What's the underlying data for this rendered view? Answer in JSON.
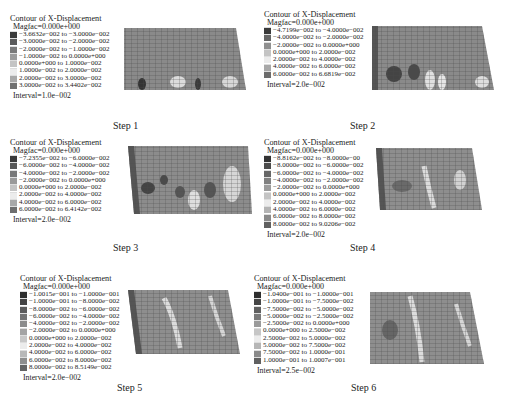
{
  "figure": {
    "panels": [
      {
        "step_label": "Step 1",
        "legend": {
          "title": "Contour of X-Displacement",
          "magfac": "Magfac=0.000e+000",
          "ranges": [
            "−3.6632e−002 to −3.0000e−002",
            "−3.0000e−002 to −2.0000e−002",
            "−2.0000e−002 to −1.0000e−002",
            "−1.0000e−002 to 0.0000e+000",
            "0.0000e+000 to 1.0000e−002",
            "1.0000e−002 to 2.0000e−002",
            "2.0000e−002 to 3.0000e−002",
            "3.0000e−002 to 3.4402e−002"
          ],
          "swatch_colors": [
            "#3a3a3a",
            "#5a5a5a",
            "#7a7a7a",
            "#9c9c9c",
            "#c4c4c4",
            "#ececec",
            "#a8a8a8",
            "#707070"
          ],
          "interval": "Interval=1.0e−002"
        }
      },
      {
        "step_label": "Step 2",
        "legend": {
          "title": "Contour of X-Displacement",
          "magfac": "Magfac=0.000e+000",
          "ranges": [
            "−4.7199e−002 to −4.0000e−002",
            "−4.0000e−002 to −2.0000e−002",
            "−2.0000e−002 to 0.0000e+000",
            "0.0000e+000 to 2.0000e−002",
            "2.0000e−002 to 4.0000e−002",
            "4.0000e−002 to 6.0000e−002",
            "6.0000e−002 to 6.6819e−002"
          ],
          "swatch_colors": [
            "#3a3a3a",
            "#666666",
            "#909090",
            "#c4c4c4",
            "#ececec",
            "#a8a8a8",
            "#6c6c6c"
          ],
          "interval": "Interval=2.0e−002"
        }
      },
      {
        "step_label": "Step 3",
        "legend": {
          "title": "Contour of X-Displacement",
          "magfac": "Magfac=0.000e+000",
          "ranges": [
            "−7.2355e−002 to −6.0000e−002",
            "−6.0000e−002 to −4.0000e−002",
            "−4.0000e−002 to −2.0000e−002",
            "−2.0000e−002 to 0.0000e+000",
            "0.0000e+000 to 2.0000e−002",
            "2.0000e−002 to 4.0000e−002",
            "4.0000e−002 to 6.0000e−002",
            "6.0000e−002 to 6.4142e−002"
          ],
          "swatch_colors": [
            "#3a3a3a",
            "#585858",
            "#787878",
            "#9a9a9a",
            "#c4c4c4",
            "#ececec",
            "#a8a8a8",
            "#6e6e6e"
          ],
          "interval": "Interval=2.0e−002"
        }
      },
      {
        "step_label": "Step 4",
        "legend": {
          "title": "Contour of X-Displacement",
          "magfac": "Magfac=0.000e+000",
          "ranges": [
            "−8.8162e−002 to −8.0000e−00",
            "−8.0000e−002 to −6.0000e−002",
            "−6.0000e−002 to −4.0000e−002",
            "−4.0000e−002 to −2.0000e−002",
            "−2.0000e−002 to 0.0000e+000",
            "0.0000e+000 to 2.0000e−002",
            "2.0000e−002 to 4.0000e−002",
            "4.0000e−002 to 6.0000e−002",
            "6.0000e−002 to 8.0000e−002",
            "8.0000e−002 to 9.0206e−002"
          ],
          "swatch_colors": [
            "#333333",
            "#4c4c4c",
            "#666666",
            "#808080",
            "#9c9c9c",
            "#c4c4c4",
            "#ececec",
            "#b4b4b4",
            "#8a8a8a",
            "#606060"
          ],
          "interval": "Interval=2.0e−002"
        }
      },
      {
        "step_label": "Step 5",
        "legend": {
          "title": "Contour of X-Displacement",
          "magfac": "Magfac=0.000e+000",
          "ranges": [
            "−1.0015e−001 to −1.0000e−001",
            "−1.0000e−001 to −8.0000e−002",
            "−8.0000e−002 to −6.0000e−002",
            "−6.0000e−002 to −4.0000e−002",
            "−4.0000e−002 to −2.0000e−002",
            "−2.0000e−002 to 0.0000e+000",
            "0.0000e+000 to 2.0000e−002",
            "2.0000e−002 to 4.0000e−002",
            "4.0000e−002 to 6.0000e−002",
            "6.0000e−002 to 8.0000e−002",
            "8.0000e−002 to 8.5149e−002"
          ],
          "swatch_colors": [
            "#2e2e2e",
            "#444444",
            "#5c5c5c",
            "#747474",
            "#8c8c8c",
            "#a4a4a4",
            "#c8c8c8",
            "#ececec",
            "#b8b8b8",
            "#8e8e8e",
            "#646464"
          ],
          "interval": "Interval=2.0e−002"
        }
      },
      {
        "step_label": "Step 6",
        "legend": {
          "title": "Contour of X-Displacement",
          "magfac": "Magfac=0.000e+000",
          "ranges": [
            "−1.0400e−001 to −1.0000e−001",
            "−1.0000e−001 to −7.5000e−002",
            "−7.5000e−002 to −5.0000e−002",
            "−5.0000e−002 to −2.5000e−002",
            "−2.5000e−002 to 0.0000e+000",
            "0.0000e+000 to 2.5000e−002",
            "2.5000e−002 to 5.0000e−002",
            "5.0000e−002 to 7.5000e−002",
            "7.5000e−002 to 1.0000e−001",
            "1.0000e−001 to 1.0007e−001"
          ],
          "swatch_colors": [
            "#2e2e2e",
            "#464646",
            "#606060",
            "#7a7a7a",
            "#9a9a9a",
            "#c6c6c6",
            "#ececec",
            "#b6b6b6",
            "#8a8a8a",
            "#606060"
          ],
          "interval": "Interval=2.5e−002"
        }
      }
    ]
  }
}
